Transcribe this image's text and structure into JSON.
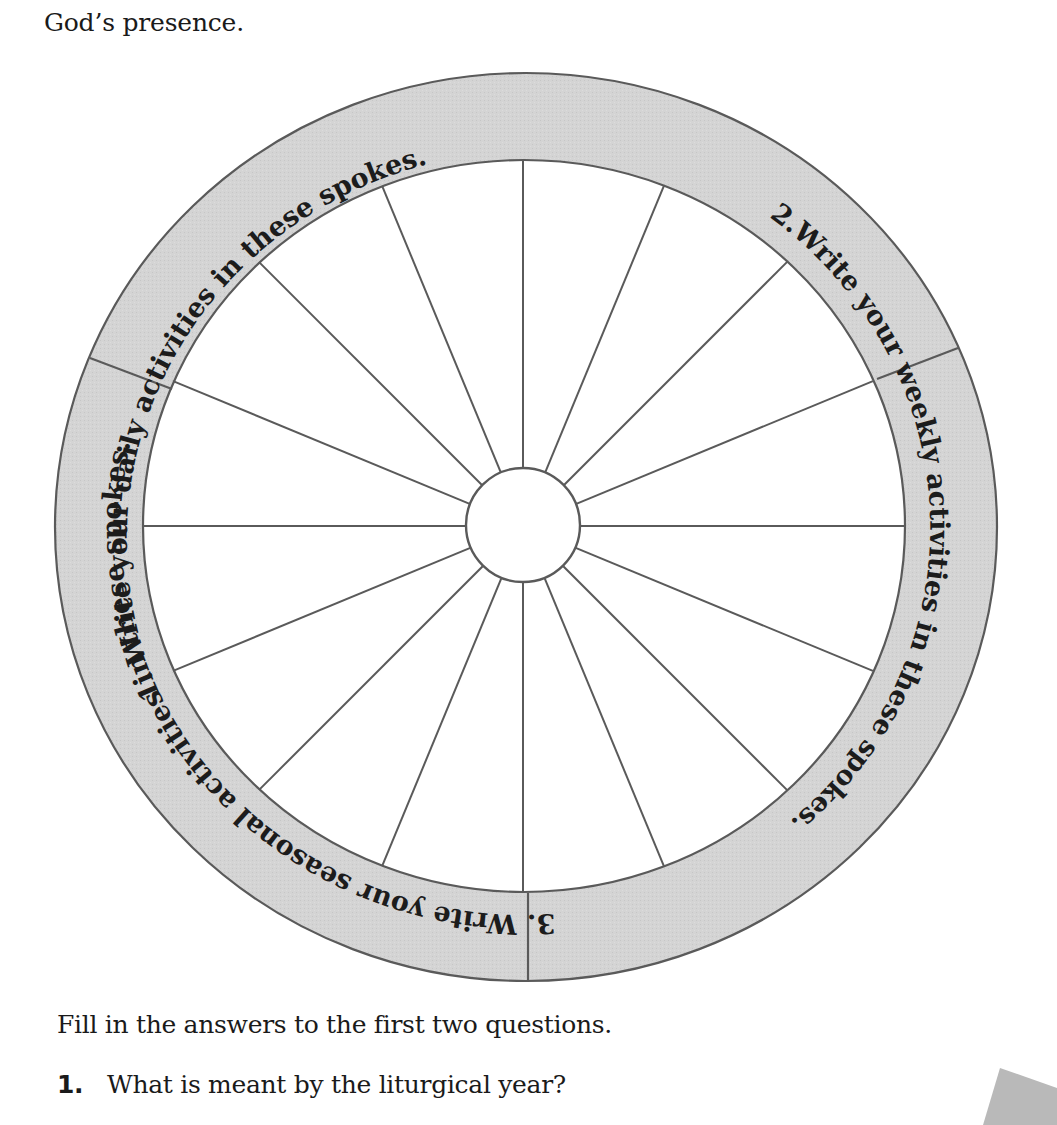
{
  "intro_text": "God’s presence.",
  "wheel": {
    "colors": {
      "band_fill": "#d4d4d4",
      "line": "#5a5a5a",
      "spoke_area": "#ffffff"
    },
    "spoke_count": 16,
    "sections": [
      {
        "id": "daily",
        "label": "1. Write your daily activities in these spokes."
      },
      {
        "id": "weekly",
        "label": "2.Write your weekly activities in these spokes."
      },
      {
        "id": "seasonal",
        "label": "3. Write your seasonal activities in these spokes."
      }
    ]
  },
  "instructions": "Fill in the answers to the first two questions.",
  "questions": [
    {
      "number": "1.",
      "text": "What is meant by the liturgical year?"
    }
  ]
}
